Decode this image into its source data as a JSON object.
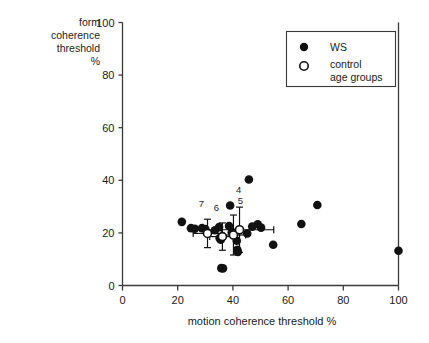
{
  "chart_data": {
    "type": "scatter",
    "title": "",
    "xlabel": "motion coherence threshold %",
    "ylabel": "form coherence threshold %",
    "ylabel_lines": [
      "form",
      "coherence",
      "threshold",
      "%"
    ],
    "xlim": [
      0,
      100
    ],
    "ylim": [
      0,
      100
    ],
    "xticks": [
      0,
      20,
      40,
      60,
      80,
      100
    ],
    "yticks": [
      0,
      20,
      40,
      60,
      80,
      100
    ],
    "grid": false,
    "legend_position": "top-right",
    "legend": [
      {
        "marker": "filled-circle",
        "label": "WS"
      },
      {
        "marker": "open-circle",
        "label_lines": [
          "control",
          "age groups"
        ]
      }
    ],
    "series": [
      {
        "name": "WS",
        "marker": "filled-circle",
        "points": [
          {
            "x": 21.5,
            "y": 24.2
          },
          {
            "x": 24.8,
            "y": 21.8
          },
          {
            "x": 26.2,
            "y": 21.6
          },
          {
            "x": 28.8,
            "y": 21.8
          },
          {
            "x": 30.0,
            "y": 21.5
          },
          {
            "x": 33.5,
            "y": 21.0
          },
          {
            "x": 35.0,
            "y": 22.2
          },
          {
            "x": 35.2,
            "y": 18.0
          },
          {
            "x": 35.6,
            "y": 17.4
          },
          {
            "x": 35.8,
            "y": 6.6
          },
          {
            "x": 36.4,
            "y": 6.5
          },
          {
            "x": 38.6,
            "y": 22.6
          },
          {
            "x": 39.0,
            "y": 30.4
          },
          {
            "x": 39.6,
            "y": 20.2
          },
          {
            "x": 40.2,
            "y": 20.0
          },
          {
            "x": 41.4,
            "y": 17.0
          },
          {
            "x": 41.6,
            "y": 13.6
          },
          {
            "x": 41.8,
            "y": 12.8
          },
          {
            "x": 45.8,
            "y": 40.3
          },
          {
            "x": 45.2,
            "y": 19.8
          },
          {
            "x": 47.0,
            "y": 22.4
          },
          {
            "x": 49.0,
            "y": 23.3
          },
          {
            "x": 50.2,
            "y": 22.0
          },
          {
            "x": 54.6,
            "y": 15.5
          },
          {
            "x": 64.8,
            "y": 23.4
          },
          {
            "x": 70.6,
            "y": 30.6
          },
          {
            "x": 100.0,
            "y": 13.2
          }
        ]
      },
      {
        "name": "control age groups",
        "marker": "open-circle",
        "points": [
          {
            "label": "7",
            "x": 30.8,
            "y": 19.8,
            "xerr": 5.2,
            "yerr": 5.4
          },
          {
            "label": "6",
            "x": 36.2,
            "y": 18.6,
            "xerr": 4.6,
            "yerr": 5.2
          },
          {
            "label": "5",
            "x": 40.2,
            "y": 19.2,
            "xerr": 4.4,
            "yerr": 7.6
          },
          {
            "label": "4",
            "x": 42.4,
            "y": 21.2,
            "xerr": 12.4,
            "yerr": 8.6
          }
        ]
      }
    ]
  },
  "colors": {
    "marker_fill": "#111111",
    "axis": "#3a3a3a",
    "background": "#ffffff",
    "text": "#1a1a1a"
  }
}
